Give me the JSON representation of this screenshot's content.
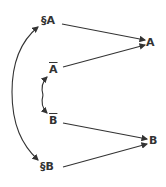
{
  "diagram": {
    "nodes": {
      "sA": "§A",
      "A": "A",
      "notA": "A",
      "notB": "B",
      "B": "B",
      "sB": "§B"
    },
    "edges": [
      {
        "from": "§A",
        "to": "A"
      },
      {
        "from": "Ā",
        "to": "A"
      },
      {
        "from": "B̄",
        "to": "B"
      },
      {
        "from": "§B",
        "to": "B"
      },
      {
        "from": "center-left",
        "to": "§A",
        "type": "curved"
      },
      {
        "from": "center-left",
        "to": "§B",
        "type": "curved"
      },
      {
        "from": "center-small",
        "to": "Ā",
        "type": "curved"
      },
      {
        "from": "center-small",
        "to": "B̄",
        "type": "curved"
      }
    ],
    "colors": {
      "ink": "#333333",
      "background": "#ffffff"
    }
  }
}
